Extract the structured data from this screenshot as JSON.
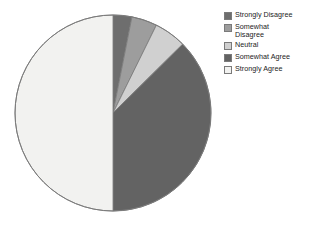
{
  "chart_data": {
    "type": "pie",
    "title": "",
    "categories": [
      "Strongly Disagree",
      "Somewhat Disagree",
      "Neutral",
      "Somewhat Agree",
      "Strongly Agree"
    ],
    "values": [
      3.1,
      4.2,
      5.3,
      37.4,
      50.0
    ],
    "unit": "percent",
    "start_angle_deg": 0,
    "direction": "clockwise",
    "legend_position": "right",
    "grid": false,
    "colors": {
      "strongly_disagree": "#6e6e6e",
      "somewhat_disagree": "#9d9d9d",
      "neutral": "#d0d0d0",
      "somewhat_agree": "#636363",
      "strongly_agree": "#f2f2f0",
      "outline": "#7a7a7a",
      "background": "#ffffff"
    }
  },
  "legend": {
    "items": [
      {
        "label": "Strongly Disagree",
        "swatch": "#6e6e6e",
        "icon": "legend-swatch-icon"
      },
      {
        "label": "Somewhat\nDisagree",
        "swatch": "#9d9d9d",
        "icon": "legend-swatch-icon"
      },
      {
        "label": "Neutral",
        "swatch": "#d0d0d0",
        "icon": "legend-swatch-icon"
      },
      {
        "label": "Somewhat Agree",
        "swatch": "#636363",
        "icon": "legend-swatch-icon"
      },
      {
        "label": "Strongly Agree",
        "swatch": "#f2f2f0",
        "icon": "legend-swatch-icon"
      }
    ]
  }
}
